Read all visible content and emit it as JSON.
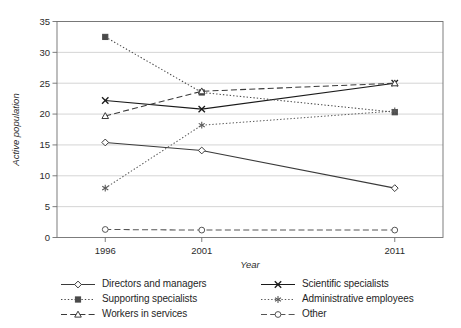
{
  "chart_data": {
    "type": "line",
    "title": "",
    "xlabel": "Year",
    "ylabel": "Active population",
    "categories": [
      "1996",
      "2001",
      "2011"
    ],
    "x": [
      1996,
      2001,
      2011
    ],
    "xlim": [
      1993.5,
      2013.5
    ],
    "ylim": [
      0,
      35
    ],
    "yticks": [
      0,
      5,
      10,
      15,
      20,
      25,
      30,
      35
    ],
    "ytick_labels": [
      "0",
      "5",
      "10",
      "15",
      "20",
      "25",
      "30",
      "35"
    ],
    "xtick_labels": [
      "1996",
      "2001",
      "2011"
    ],
    "grid": "horizontal",
    "legend_position": "bottom",
    "legend_columns": 2,
    "series": [
      {
        "name": "Directors and managers",
        "marker": "diamond-open",
        "line": "solid",
        "color": "#3a3a3a",
        "values": [
          15.4,
          14.1,
          8.0
        ]
      },
      {
        "name": "Scientific specialists",
        "marker": "cross-x",
        "line": "solid",
        "color": "#1a1a1a",
        "values": [
          22.2,
          20.8,
          25.0
        ]
      },
      {
        "name": "Supporting specialists",
        "marker": "square-filled",
        "line": "dotted",
        "color": "#4a4a4a",
        "values": [
          32.5,
          23.5,
          20.3
        ]
      },
      {
        "name": "Administrative employees",
        "marker": "asterisk",
        "line": "dotted",
        "color": "#5a5a5a",
        "values": [
          8.0,
          18.2,
          20.5
        ]
      },
      {
        "name": "Workers in services",
        "marker": "triangle-open",
        "line": "dashed",
        "color": "#3a3a3a",
        "values": [
          19.7,
          23.7,
          25.0
        ]
      },
      {
        "name": "Other",
        "marker": "circle-open",
        "line": "dashed",
        "color": "#555555",
        "values": [
          1.3,
          1.2,
          1.2
        ]
      }
    ]
  },
  "legend": {
    "items": [
      {
        "label": "Directors and managers"
      },
      {
        "label": "Scientific specialists"
      },
      {
        "label": "Supporting specialists"
      },
      {
        "label": "Administrative employees"
      },
      {
        "label": "Workers in services"
      },
      {
        "label": "Other"
      }
    ]
  }
}
